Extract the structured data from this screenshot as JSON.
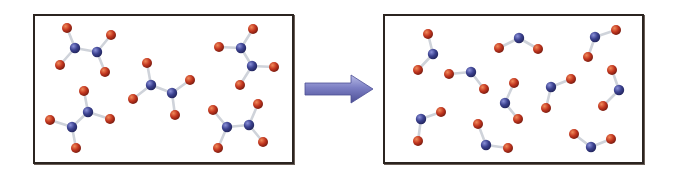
{
  "figure": {
    "width": 677,
    "height": 173,
    "colors": {
      "background": "#ffffff",
      "panel_border": "#2b2420",
      "nitrogen": "#3b418f",
      "nitrogen_highlight": "#8a90d8",
      "oxygen": "#c2361f",
      "oxygen_highlight": "#f08a5a",
      "bond": "#cfd3da",
      "arrow_fill": "#7c7fc4",
      "arrow_dark": "#4d4f95",
      "arrow_light": "#b8bbe6"
    },
    "atom_radius": {
      "N": 5.2,
      "O": 5.0
    },
    "left_panel": {
      "label": "reactant",
      "box": {
        "x": 33,
        "y": 14,
        "w": 261,
        "h": 150
      },
      "molecule_type": "N2O4",
      "molecule_count": 5,
      "molecules": [
        {
          "atoms": [
            {
              "el": "O",
              "x": 67,
              "y": 28
            },
            {
              "el": "N",
              "x": 75,
              "y": 48
            },
            {
              "el": "O",
              "x": 60,
              "y": 65
            },
            {
              "el": "N",
              "x": 97,
              "y": 52
            },
            {
              "el": "O",
              "x": 111,
              "y": 35
            },
            {
              "el": "O",
              "x": 105,
              "y": 72
            }
          ],
          "bonds": [
            [
              0,
              1
            ],
            [
              1,
              2
            ],
            [
              1,
              3
            ],
            [
              3,
              4
            ],
            [
              3,
              5
            ]
          ]
        },
        {
          "atoms": [
            {
              "el": "O",
              "x": 84,
              "y": 91
            },
            {
              "el": "N",
              "x": 88,
              "y": 112
            },
            {
              "el": "O",
              "x": 110,
              "y": 119
            },
            {
              "el": "N",
              "x": 72,
              "y": 127
            },
            {
              "el": "O",
              "x": 50,
              "y": 120
            },
            {
              "el": "O",
              "x": 76,
              "y": 148
            }
          ],
          "bonds": [
            [
              0,
              1
            ],
            [
              1,
              2
            ],
            [
              1,
              3
            ],
            [
              3,
              4
            ],
            [
              3,
              5
            ]
          ]
        },
        {
          "atoms": [
            {
              "el": "O",
              "x": 147,
              "y": 63
            },
            {
              "el": "N",
              "x": 151,
              "y": 85
            },
            {
              "el": "O",
              "x": 133,
              "y": 99
            },
            {
              "el": "N",
              "x": 172,
              "y": 93
            },
            {
              "el": "O",
              "x": 190,
              "y": 80
            },
            {
              "el": "O",
              "x": 175,
              "y": 115
            }
          ],
          "bonds": [
            [
              0,
              1
            ],
            [
              1,
              2
            ],
            [
              1,
              3
            ],
            [
              3,
              4
            ],
            [
              3,
              5
            ]
          ]
        },
        {
          "atoms": [
            {
              "el": "O",
              "x": 253,
              "y": 29
            },
            {
              "el": "N",
              "x": 241,
              "y": 48
            },
            {
              "el": "O",
              "x": 219,
              "y": 47
            },
            {
              "el": "N",
              "x": 252,
              "y": 66
            },
            {
              "el": "O",
              "x": 274,
              "y": 67
            },
            {
              "el": "O",
              "x": 240,
              "y": 85
            }
          ],
          "bonds": [
            [
              0,
              1
            ],
            [
              1,
              2
            ],
            [
              1,
              3
            ],
            [
              3,
              4
            ],
            [
              3,
              5
            ]
          ]
        },
        {
          "atoms": [
            {
              "el": "O",
              "x": 213,
              "y": 110
            },
            {
              "el": "N",
              "x": 227,
              "y": 127
            },
            {
              "el": "O",
              "x": 218,
              "y": 148
            },
            {
              "el": "N",
              "x": 249,
              "y": 125
            },
            {
              "el": "O",
              "x": 258,
              "y": 104
            },
            {
              "el": "O",
              "x": 263,
              "y": 142
            }
          ],
          "bonds": [
            [
              0,
              1
            ],
            [
              1,
              2
            ],
            [
              1,
              3
            ],
            [
              3,
              4
            ],
            [
              3,
              5
            ]
          ]
        }
      ]
    },
    "arrow": {
      "label": "right-arrow",
      "x1": 305,
      "x2": 373,
      "y": 89,
      "shaft_height": 12,
      "head_height": 28,
      "head_length": 22
    },
    "right_panel": {
      "label": "product",
      "box": {
        "x": 383,
        "y": 14,
        "w": 261,
        "h": 150
      },
      "molecule_type": "NO2",
      "molecule_count": 10,
      "molecules": [
        {
          "atoms": [
            {
              "el": "O",
              "x": 428,
              "y": 34
            },
            {
              "el": "N",
              "x": 433,
              "y": 54
            },
            {
              "el": "O",
              "x": 418,
              "y": 70
            }
          ],
          "bonds": [
            [
              0,
              1
            ],
            [
              1,
              2
            ]
          ]
        },
        {
          "atoms": [
            {
              "el": "O",
              "x": 449,
              "y": 74
            },
            {
              "el": "N",
              "x": 471,
              "y": 72
            },
            {
              "el": "O",
              "x": 484,
              "y": 89
            }
          ],
          "bonds": [
            [
              0,
              1
            ],
            [
              1,
              2
            ]
          ]
        },
        {
          "atoms": [
            {
              "el": "O",
              "x": 499,
              "y": 48
            },
            {
              "el": "N",
              "x": 519,
              "y": 38
            },
            {
              "el": "O",
              "x": 538,
              "y": 49
            }
          ],
          "bonds": [
            [
              0,
              1
            ],
            [
              1,
              2
            ]
          ]
        },
        {
          "atoms": [
            {
              "el": "O",
              "x": 616,
              "y": 30
            },
            {
              "el": "N",
              "x": 595,
              "y": 37
            },
            {
              "el": "O",
              "x": 588,
              "y": 57
            }
          ],
          "bonds": [
            [
              0,
              1
            ],
            [
              1,
              2
            ]
          ]
        },
        {
          "atoms": [
            {
              "el": "O",
              "x": 612,
              "y": 70
            },
            {
              "el": "N",
              "x": 619,
              "y": 90
            },
            {
              "el": "O",
              "x": 603,
              "y": 106
            }
          ],
          "bonds": [
            [
              0,
              1
            ],
            [
              1,
              2
            ]
          ]
        },
        {
          "atoms": [
            {
              "el": "O",
              "x": 571,
              "y": 79
            },
            {
              "el": "N",
              "x": 551,
              "y": 87
            },
            {
              "el": "O",
              "x": 546,
              "y": 108
            }
          ],
          "bonds": [
            [
              0,
              1
            ],
            [
              1,
              2
            ]
          ]
        },
        {
          "atoms": [
            {
              "el": "O",
              "x": 514,
              "y": 83
            },
            {
              "el": "N",
              "x": 505,
              "y": 103
            },
            {
              "el": "O",
              "x": 518,
              "y": 119
            }
          ],
          "bonds": [
            [
              0,
              1
            ],
            [
              1,
              2
            ]
          ]
        },
        {
          "atoms": [
            {
              "el": "O",
              "x": 441,
              "y": 112
            },
            {
              "el": "N",
              "x": 421,
              "y": 119
            },
            {
              "el": "O",
              "x": 418,
              "y": 141
            }
          ],
          "bonds": [
            [
              0,
              1
            ],
            [
              1,
              2
            ]
          ]
        },
        {
          "atoms": [
            {
              "el": "O",
              "x": 478,
              "y": 124
            },
            {
              "el": "N",
              "x": 486,
              "y": 145
            },
            {
              "el": "O",
              "x": 508,
              "y": 148
            }
          ],
          "bonds": [
            [
              0,
              1
            ],
            [
              1,
              2
            ]
          ]
        },
        {
          "atoms": [
            {
              "el": "O",
              "x": 574,
              "y": 134
            },
            {
              "el": "N",
              "x": 591,
              "y": 147
            },
            {
              "el": "O",
              "x": 611,
              "y": 139
            }
          ],
          "bonds": [
            [
              0,
              1
            ],
            [
              1,
              2
            ]
          ]
        }
      ]
    }
  }
}
